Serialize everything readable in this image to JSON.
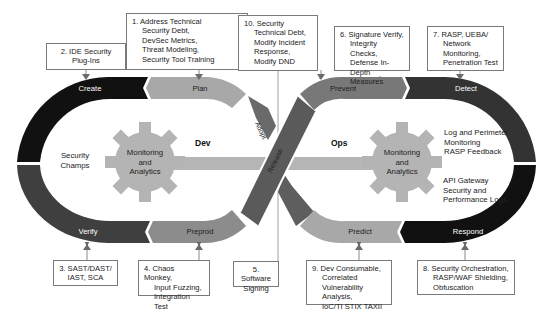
{
  "diagram": {
    "colors": {
      "black": "#111111",
      "dark_gray": "#3a3a3a",
      "mid_gray": "#5e5e5e",
      "gray": "#858585",
      "light_gray": "#a8a8a8",
      "gear": "#b4b4b4",
      "bar": "#b6b6b6"
    },
    "loops": {
      "dev_label": "Dev",
      "ops_label": "Ops"
    },
    "stages": {
      "create": "Create",
      "plan": "Plan",
      "verify": "Verify",
      "preprod": "Preprod",
      "adopt": "Adopt",
      "release": "Release",
      "prevent": "Prevent",
      "detect": "Detect",
      "predict": "Predict",
      "respond": "Respond"
    },
    "gears": {
      "left": [
        "Monitoring",
        "and",
        "Analytics"
      ],
      "right": [
        "Monitoring",
        "and",
        "Analytics"
      ]
    },
    "inner_text": {
      "security_champs": [
        "Security",
        "Champs"
      ],
      "log_perimeter": [
        "Log and Perimeter",
        "Monitoring",
        "RASP Feedback"
      ],
      "api_gateway": [
        "API Gateway",
        "Security and",
        "Performance Logs"
      ]
    },
    "callouts": [
      {
        "id": "1",
        "first": "1. Address Technical",
        "rest": [
          "Security Debt,",
          "DevSec Metrics,",
          "Threat Modeling,",
          "Security Tool Training"
        ]
      },
      {
        "id": "2",
        "first": "2. IDE Security",
        "rest": [
          "Plug-Ins"
        ]
      },
      {
        "id": "3",
        "first": "3. SAST/DAST/",
        "rest": [
          "IAST, SCA"
        ]
      },
      {
        "id": "4",
        "first": "4. Chaos Monkey,",
        "rest": [
          "Input Fuzzing,",
          "Integration Test"
        ]
      },
      {
        "id": "5",
        "first": "5. Software",
        "rest": [
          "Signing"
        ]
      },
      {
        "id": "6",
        "first": "6. Signature Verify,",
        "rest": [
          "Integrity Checks,",
          "Defense In-",
          "Depth Measures"
        ]
      },
      {
        "id": "7",
        "first": "7. RASP, UEBA/",
        "rest": [
          "Network",
          "Monitoring,",
          "Penetration Test"
        ]
      },
      {
        "id": "8",
        "first": "8. Security Orchestration,",
        "rest": [
          "RASP/WAF Shielding,",
          "Obfuscation"
        ]
      },
      {
        "id": "9",
        "first": "9. Dev Consumable,",
        "rest": [
          "Correlated",
          "Vulnerability Analysis,",
          "IoC/TI STIX TAXII"
        ]
      },
      {
        "id": "10",
        "first": "10. Security",
        "rest": [
          "Technical Debt,",
          "Modify Incident",
          "Response,",
          "Modify DND"
        ]
      }
    ]
  }
}
